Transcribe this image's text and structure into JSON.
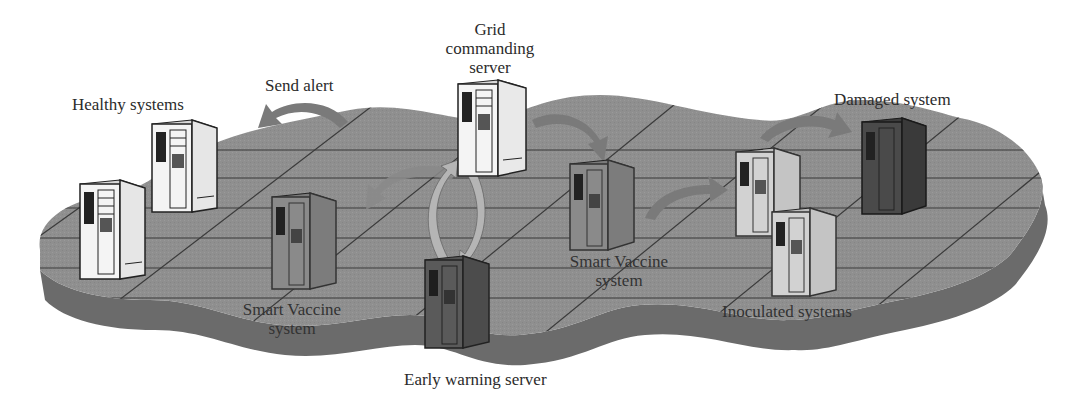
{
  "diagram": {
    "type": "network-illustration",
    "colors": {
      "platform_top": "#8f8f8f",
      "platform_side": "#6b6b6b",
      "grid_lines": "#3a3a3a",
      "server_white": "#f4f4f4",
      "server_gray": "#8a8a8a",
      "server_dark": "#4a4a4a",
      "arrow_gray": "#7a7a7a",
      "arrow_light": "#b5b5b5",
      "text": "#2b2b2b"
    },
    "labels": {
      "healthy": "Healthy systems",
      "send_alert": "Send alert",
      "grid_line1": "Grid",
      "grid_line2": "commanding",
      "grid_line3": "server",
      "damaged": "Damaged system",
      "sv_left_line1": "Smart Vaccine",
      "sv_left_line2": "system",
      "sv_center_line1": "Smart Vaccine",
      "sv_center_line2": "system",
      "inoculated": "Inoculated systems",
      "early_warning": "Early warning server"
    },
    "nodes": [
      {
        "id": "healthy-1",
        "role": "Healthy system",
        "style": "white"
      },
      {
        "id": "healthy-2",
        "role": "Healthy system",
        "style": "white"
      },
      {
        "id": "grid-commanding-server",
        "role": "Grid commanding server",
        "style": "white"
      },
      {
        "id": "smart-vaccine-left",
        "role": "Smart Vaccine system",
        "style": "gray"
      },
      {
        "id": "early-warning-server",
        "role": "Early warning server",
        "style": "dark-gray"
      },
      {
        "id": "smart-vaccine-center",
        "role": "Smart Vaccine system",
        "style": "gray"
      },
      {
        "id": "inoculated-1",
        "role": "Inoculated system",
        "style": "light-gray"
      },
      {
        "id": "inoculated-2",
        "role": "Inoculated system",
        "style": "light-gray"
      },
      {
        "id": "damaged-system",
        "role": "Damaged system",
        "style": "dark"
      }
    ],
    "edges": [
      {
        "from": "grid-commanding-server",
        "to": "healthy",
        "label": "Send alert"
      },
      {
        "from": "grid-commanding-server",
        "to": "smart-vaccine-left"
      },
      {
        "from": "grid-commanding-server",
        "to": "smart-vaccine-center"
      },
      {
        "from": "early-warning-server",
        "to": "grid-commanding-server"
      },
      {
        "from": "grid-commanding-server",
        "to": "early-warning-server"
      },
      {
        "from": "smart-vaccine-center",
        "to": "inoculated-1"
      },
      {
        "from": "inoculated-1",
        "to": "damaged-system"
      }
    ]
  }
}
